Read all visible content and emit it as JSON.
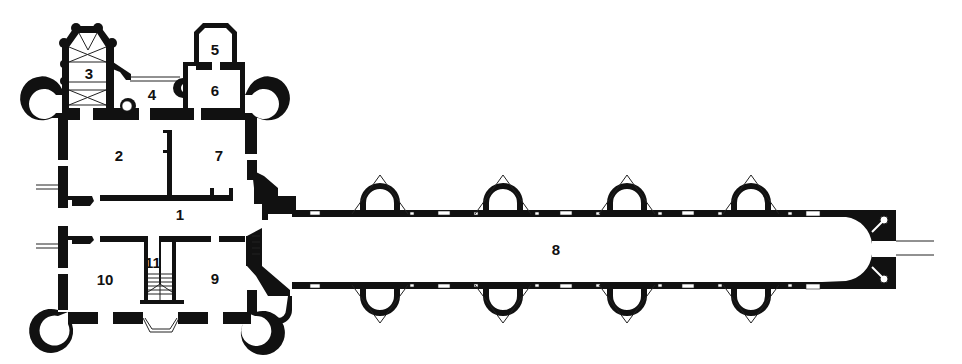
{
  "diagram": {
    "type": "architectural-floor-plan",
    "colors": {
      "walls": "#111111",
      "background": "#ffffff",
      "lines": "#222222"
    },
    "rooms": [
      {
        "id": "1",
        "label": "1",
        "x": 180,
        "y": 214
      },
      {
        "id": "2",
        "label": "2",
        "x": 119,
        "y": 155
      },
      {
        "id": "3",
        "label": "3",
        "x": 89,
        "y": 73
      },
      {
        "id": "4",
        "label": "4",
        "x": 152,
        "y": 94
      },
      {
        "id": "5",
        "label": "5",
        "x": 215,
        "y": 49
      },
      {
        "id": "6",
        "label": "6",
        "x": 215,
        "y": 90
      },
      {
        "id": "7",
        "label": "7",
        "x": 219,
        "y": 155
      },
      {
        "id": "8",
        "label": "8",
        "x": 556,
        "y": 249
      },
      {
        "id": "9",
        "label": "9",
        "x": 215,
        "y": 278
      },
      {
        "id": "10",
        "label": "10",
        "x": 105,
        "y": 279
      },
      {
        "id": "11",
        "label": "11",
        "x": 153,
        "y": 262
      }
    ]
  }
}
